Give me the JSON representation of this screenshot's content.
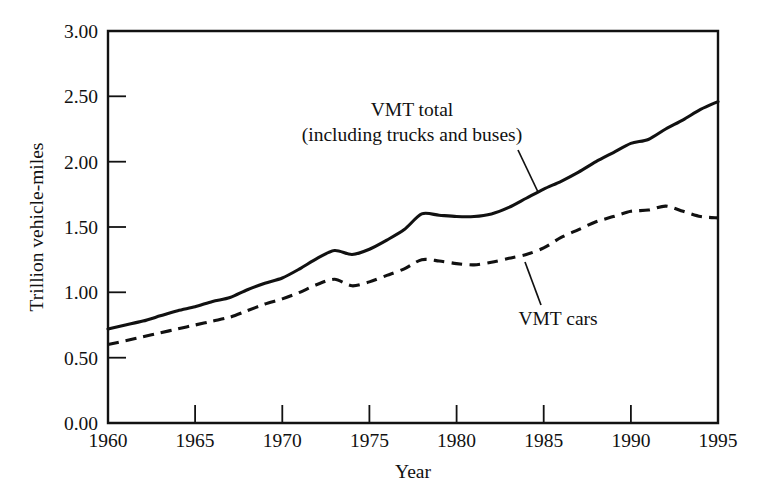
{
  "chart_data": {
    "type": "line",
    "title": "",
    "xlabel": "Year",
    "ylabel": "Trillion vehicle-miles",
    "xlim": [
      1960,
      1995
    ],
    "ylim": [
      0.0,
      3.0
    ],
    "grid": false,
    "legend_position": "inline-annotations",
    "xticks": [
      "1960",
      "1965",
      "1970",
      "1975",
      "1980",
      "1985",
      "1990",
      "1995"
    ],
    "yticks": [
      "0.00",
      "0.50",
      "1.00",
      "1.50",
      "2.00",
      "2.50",
      "3.00"
    ],
    "x": [
      1960,
      1961,
      1962,
      1963,
      1964,
      1965,
      1966,
      1967,
      1968,
      1969,
      1970,
      1971,
      1972,
      1973,
      1974,
      1975,
      1976,
      1977,
      1978,
      1979,
      1980,
      1981,
      1982,
      1983,
      1984,
      1985,
      1986,
      1987,
      1988,
      1989,
      1990,
      1991,
      1992,
      1993,
      1994,
      1995
    ],
    "series": [
      {
        "name": "VMT total",
        "style": "solid",
        "values": [
          0.72,
          0.75,
          0.78,
          0.82,
          0.86,
          0.89,
          0.93,
          0.96,
          1.02,
          1.07,
          1.11,
          1.18,
          1.26,
          1.32,
          1.29,
          1.33,
          1.4,
          1.48,
          1.6,
          1.59,
          1.58,
          1.58,
          1.6,
          1.65,
          1.72,
          1.79,
          1.85,
          1.92,
          2.0,
          2.07,
          2.14,
          2.17,
          2.25,
          2.32,
          2.4,
          2.46
        ],
        "annotation": "VMT total\n(including trucks and buses)"
      },
      {
        "name": "VMT cars",
        "style": "dashed",
        "values": [
          0.6,
          0.63,
          0.66,
          0.69,
          0.72,
          0.75,
          0.78,
          0.81,
          0.86,
          0.91,
          0.95,
          1.0,
          1.06,
          1.1,
          1.05,
          1.08,
          1.13,
          1.18,
          1.25,
          1.24,
          1.22,
          1.21,
          1.23,
          1.26,
          1.29,
          1.34,
          1.42,
          1.48,
          1.54,
          1.58,
          1.62,
          1.63,
          1.66,
          1.62,
          1.58,
          1.57
        ],
        "annotation": "VMT cars"
      }
    ]
  },
  "annotations": {
    "total_line1": "VMT total",
    "total_line2": "(including trucks and buses)",
    "cars_label": "VMT cars"
  },
  "axes": {
    "y_title": "Trillion vehicle-miles",
    "x_title": "Year",
    "y_tick_0": "0.00",
    "y_tick_1": "0.50",
    "y_tick_2": "1.00",
    "y_tick_3": "1.50",
    "y_tick_4": "2.00",
    "y_tick_5": "2.50",
    "y_tick_6": "3.00",
    "x_tick_0": "1960",
    "x_tick_1": "1965",
    "x_tick_2": "1970",
    "x_tick_3": "1975",
    "x_tick_4": "1980",
    "x_tick_5": "1985",
    "x_tick_6": "1990",
    "x_tick_7": "1995"
  },
  "colors": {
    "ink": "#111111",
    "background": "#ffffff"
  }
}
